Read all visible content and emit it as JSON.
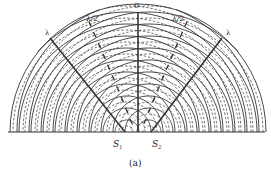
{
  "diagram": {
    "labels": {
      "center_line": "0",
      "half_wave_left": "λ/2",
      "half_wave_right": "λ/2",
      "full_wave_left": "λ",
      "full_wave_right": "λ",
      "source_1": "S",
      "source_1_sub": "1",
      "source_2": "S",
      "source_2_sub": "2",
      "caption": "(a)"
    },
    "colors": {
      "line": "#333333",
      "background": "#ffffff"
    },
    "geometry": {
      "baseline_y": 132,
      "source_1_x": 127,
      "source_2_x": 149,
      "wavelength_px": 12,
      "crest_count": 9
    }
  }
}
